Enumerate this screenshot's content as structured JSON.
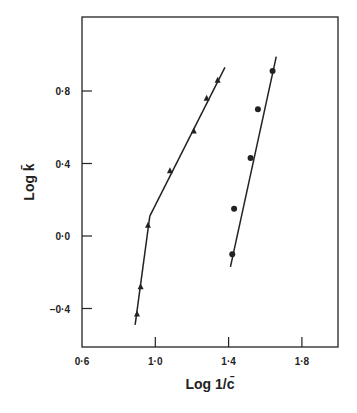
{
  "chart_data": {
    "type": "line",
    "title": "",
    "xlabel": "Log 1/c̄",
    "ylabel": "Log k̄",
    "xlim": [
      0.6,
      2.0
    ],
    "ylim": [
      -0.6,
      1.2
    ],
    "xticks": [
      0.6,
      1.0,
      1.4,
      1.8
    ],
    "xtick_labels": [
      "0·6",
      "1·0",
      "1·4",
      "1·8"
    ],
    "yticks": [
      -0.4,
      0.0,
      0.4,
      0.8
    ],
    "ytick_labels": [
      "−0·4",
      "0·0",
      "0·4",
      "0·8"
    ],
    "grid": false,
    "legend": null,
    "series": [
      {
        "name": "triangles",
        "marker": "triangle",
        "x": [
          0.9,
          0.92,
          0.96,
          1.08,
          1.21,
          1.28,
          1.34
        ],
        "y": [
          -0.43,
          -0.28,
          0.06,
          0.36,
          0.58,
          0.76,
          0.86
        ],
        "fit_lines": [
          {
            "x": [
              0.89,
              0.97
            ],
            "y": [
              -0.49,
              0.11
            ]
          },
          {
            "x": [
              0.97,
              1.38
            ],
            "y": [
              0.11,
              0.93
            ]
          }
        ]
      },
      {
        "name": "circles",
        "marker": "circle",
        "x": [
          1.42,
          1.43,
          1.52,
          1.56,
          1.64
        ],
        "y": [
          -0.1,
          0.15,
          0.43,
          0.7,
          0.91
        ],
        "fit_lines": [
          {
            "x": [
              1.41,
              1.66
            ],
            "y": [
              -0.17,
              0.99
            ]
          }
        ]
      }
    ]
  }
}
